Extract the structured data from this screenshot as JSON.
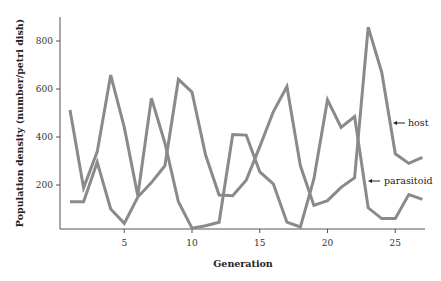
{
  "chart_data": {
    "type": "line",
    "title": "",
    "xlabel": "Generation",
    "ylabel": "Population density (number/petri dish)",
    "xlim": [
      0.3,
      27.2
    ],
    "ylim": [
      0,
      900
    ],
    "xticks": [
      5,
      10,
      15,
      20,
      25
    ],
    "yticks": [
      200,
      400,
      600,
      800
    ],
    "grid": false,
    "legend": "inline annotations with arrows on right",
    "x": [
      1,
      2,
      3,
      4,
      5,
      6,
      7,
      8,
      9,
      10,
      11,
      12,
      13,
      14,
      15,
      16,
      17,
      18,
      19,
      20,
      21,
      22,
      23,
      24,
      25,
      26,
      27
    ],
    "series": [
      {
        "name": "host",
        "color": "#8a8a8a",
        "values": [
          130,
          130,
          295,
          100,
          40,
          150,
          210,
          280,
          640,
          587,
          325,
          158,
          155,
          220,
          360,
          505,
          610,
          280,
          115,
          135,
          190,
          230,
          858,
          670,
          330,
          290,
          315
        ]
      },
      {
        "name": "parasitoid",
        "color": "#8a8a8a",
        "values": [
          512,
          188,
          338,
          658,
          440,
          155,
          562,
          375,
          130,
          20,
          30,
          45,
          410,
          408,
          255,
          205,
          45,
          25,
          225,
          555,
          440,
          485,
          105,
          60,
          60,
          160,
          140
        ]
      }
    ],
    "annotations": [
      {
        "text": "host",
        "arrow": "←"
      },
      {
        "text": "parasitoid",
        "arrow": "←"
      }
    ]
  }
}
